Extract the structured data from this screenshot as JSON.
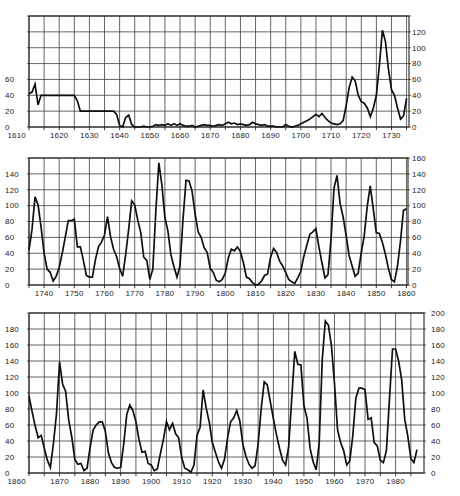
{
  "figure": {
    "background_color": "#ffffff",
    "grid_color": "#3d3d3d",
    "border_color": "#222222",
    "curve_color": "#0f0f0f",
    "label_color": "#1c1c1c"
  },
  "chart_data": [
    {
      "type": "line",
      "title": "",
      "xlabel": "",
      "ylabel": "",
      "xlim": [
        1610,
        1735.8
      ],
      "ylim": [
        0,
        140
      ],
      "x_grid_step_years": 5,
      "y_grid_step": 20,
      "grid": true,
      "x_tick_labels": [
        "1610",
        "1620",
        "1630",
        "1640",
        "1650",
        "1660",
        "1670",
        "1680",
        "1690",
        "1700",
        "1710",
        "1720",
        "1730"
      ],
      "y_tick_labels_left": [
        "60",
        "40",
        "20",
        "0"
      ],
      "y_tick_labels_right": [
        "120",
        "100",
        "80",
        "60",
        "40",
        "20",
        "0"
      ],
      "series_start_year": 1610,
      "values": [
        42,
        44,
        54,
        28,
        40,
        40,
        40,
        40,
        40,
        40,
        40,
        40,
        40,
        40,
        40,
        40,
        33,
        20,
        20,
        20,
        20,
        20,
        20,
        20,
        20,
        20,
        20,
        20,
        20,
        16,
        2,
        0,
        12,
        15,
        3,
        0,
        0,
        0,
        1,
        0,
        0,
        1,
        3,
        2,
        3,
        2,
        4,
        2,
        4,
        2,
        4,
        2,
        1,
        1,
        2,
        0,
        1,
        2,
        3,
        2,
        2,
        1,
        2,
        3,
        2,
        4,
        6,
        4,
        5,
        3,
        4,
        3,
        2,
        3,
        6,
        4,
        3,
        2,
        3,
        1,
        1,
        1,
        0,
        0,
        0,
        3,
        1,
        0,
        1,
        2,
        4,
        6,
        8,
        10,
        13,
        16,
        13,
        17,
        12,
        8,
        5,
        4,
        3,
        4,
        8,
        27,
        50,
        63,
        58,
        40,
        32,
        30,
        24,
        13,
        24,
        40,
        78,
        122,
        108,
        73,
        47,
        40,
        24,
        10,
        14,
        36
      ]
    },
    {
      "type": "line",
      "title": "",
      "xlabel": "",
      "ylabel": "",
      "xlim": [
        1735,
        1860.5
      ],
      "ylim": [
        0,
        160
      ],
      "x_grid_step_years": 5,
      "y_grid_step": 20,
      "grid": true,
      "x_tick_labels": [
        "1740",
        "1750",
        "1760",
        "1770",
        "1780",
        "1790",
        "1800",
        "1810",
        "1820",
        "1830",
        "1840",
        "1850",
        "1860"
      ],
      "y_tick_labels_left": [
        "140",
        "120",
        "100",
        "80",
        "60",
        "40",
        "20",
        "0"
      ],
      "y_tick_labels_right": [
        "160",
        "140",
        "120",
        "100",
        "80",
        "60",
        "40",
        "20",
        "0"
      ],
      "series_start_year": 1735,
      "values": [
        44,
        70,
        111,
        101,
        73,
        40,
        20,
        16,
        5,
        11,
        22,
        40,
        60,
        81,
        81,
        83,
        48,
        48,
        31,
        12,
        10,
        10,
        32,
        48,
        54,
        63,
        86,
        61,
        45,
        36,
        21,
        11,
        38,
        70,
        106,
        101,
        82,
        66,
        35,
        31,
        7,
        20,
        93,
        154,
        126,
        85,
        68,
        38,
        23,
        10,
        24,
        83,
        132,
        131,
        118,
        90,
        67,
        60,
        47,
        41,
        21,
        16,
        6,
        4,
        7,
        15,
        34,
        45,
        43,
        48,
        42,
        28,
        10,
        8,
        3,
        0,
        1,
        5,
        12,
        14,
        35,
        46,
        41,
        30,
        24,
        16,
        7,
        4,
        2,
        9,
        17,
        36,
        50,
        64,
        67,
        71,
        48,
        28,
        9,
        13,
        57,
        122,
        138,
        103,
        86,
        63,
        37,
        24,
        11,
        15,
        40,
        62,
        99,
        125,
        96,
        66,
        65,
        54,
        39,
        21,
        7,
        4,
        23,
        55,
        94,
        96
      ]
    },
    {
      "type": "line",
      "title": "",
      "xlabel": "",
      "ylabel": "",
      "xlim": [
        1860,
        1989.3
      ],
      "ylim": [
        0,
        200
      ],
      "x_grid_step_years": 5,
      "y_grid_step": 20,
      "grid": true,
      "x_tick_labels": [
        "1860",
        "1870",
        "1880",
        "1890",
        "1900",
        "1910",
        "1920",
        "1930",
        "1940",
        "1950",
        "1960",
        "1970",
        "1980"
      ],
      "y_tick_labels_left": [
        "180",
        "160",
        "140",
        "120",
        "100",
        "80",
        "60",
        "40",
        "20",
        "0"
      ],
      "y_tick_labels_right": [
        "200",
        "180",
        "160",
        "140",
        "120",
        "100",
        "80",
        "60",
        "40",
        "20",
        "0"
      ],
      "series_start_year": 1860,
      "values": [
        96,
        77,
        59,
        44,
        47,
        31,
        16,
        7,
        37,
        74,
        139,
        111,
        102,
        66,
        45,
        17,
        11,
        12,
        3,
        6,
        32,
        54,
        60,
        64,
        64,
        52,
        25,
        13,
        7,
        6,
        7,
        36,
        73,
        85,
        78,
        64,
        42,
        26,
        27,
        12,
        10,
        3,
        5,
        24,
        42,
        64,
        54,
        62,
        49,
        44,
        19,
        6,
        4,
        1,
        10,
        47,
        57,
        104,
        81,
        64,
        38,
        26,
        14,
        6,
        17,
        44,
        64,
        69,
        78,
        65,
        36,
        21,
        11,
        6,
        9,
        36,
        80,
        114,
        110,
        89,
        68,
        48,
        31,
        16,
        10,
        33,
        93,
        152,
        136,
        135,
        84,
        69,
        31,
        14,
        4,
        38,
        142,
        190,
        185,
        159,
        112,
        54,
        38,
        28,
        10,
        15,
        47,
        94,
        106,
        106,
        104,
        67,
        69,
        38,
        34,
        16,
        13,
        28,
        93,
        155,
        155,
        140,
        116,
        67,
        46,
        18,
        13,
        29
      ]
    }
  ]
}
